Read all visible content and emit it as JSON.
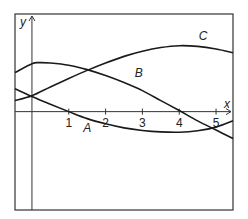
{
  "chart_data": {
    "type": "line",
    "title": "",
    "xlabel": "x",
    "ylabel": "y",
    "xlim": [
      -0.46,
      5.46
    ],
    "ylim": [
      -2.67,
      2.65
    ],
    "grid": false,
    "legend": "none (curves labelled inline)",
    "x_ticks": [
      1,
      2,
      3,
      4,
      5
    ],
    "x_tick_labels": [
      "1",
      "2",
      "3",
      "4",
      "5"
    ],
    "series": [
      {
        "name": "A",
        "points": [
          [
            -0.46,
            0.62
          ],
          [
            0,
            0.41
          ],
          [
            0.5,
            0.2
          ],
          [
            1,
            0
          ],
          [
            1.5,
            -0.19
          ],
          [
            2,
            -0.33
          ],
          [
            2.5,
            -0.44
          ],
          [
            3,
            -0.51
          ],
          [
            3.5,
            -0.55
          ],
          [
            4,
            -0.56
          ],
          [
            4.5,
            -0.52
          ],
          [
            5,
            -0.42
          ],
          [
            5.46,
            -0.25
          ]
        ]
      },
      {
        "name": "B",
        "points": [
          [
            -0.46,
            1.06
          ],
          [
            0,
            1.3
          ],
          [
            0.2,
            1.33
          ],
          [
            0.5,
            1.32
          ],
          [
            1,
            1.26
          ],
          [
            1.5,
            1.14
          ],
          [
            2,
            0.98
          ],
          [
            2.5,
            0.79
          ],
          [
            3,
            0.57
          ],
          [
            3.5,
            0.3
          ],
          [
            4,
            0.03
          ],
          [
            4.5,
            -0.25
          ],
          [
            5,
            -0.5
          ],
          [
            5.46,
            -0.73
          ]
        ]
      },
      {
        "name": "C",
        "points": [
          [
            -0.46,
            0.3
          ],
          [
            0,
            0.43
          ],
          [
            0.5,
            0.67
          ],
          [
            1,
            0.9
          ],
          [
            1.5,
            1.12
          ],
          [
            2,
            1.32
          ],
          [
            2.5,
            1.5
          ],
          [
            3,
            1.64
          ],
          [
            3.5,
            1.74
          ],
          [
            4,
            1.79
          ],
          [
            4.5,
            1.77
          ],
          [
            5,
            1.7
          ],
          [
            5.46,
            1.6
          ]
        ]
      }
    ],
    "annotations": [
      {
        "text": "A",
        "x": 1.5,
        "y": -0.55
      },
      {
        "text": "B",
        "x": 2.9,
        "y": 0.95
      },
      {
        "text": "C",
        "x": 4.65,
        "y": 1.95
      }
    ]
  }
}
